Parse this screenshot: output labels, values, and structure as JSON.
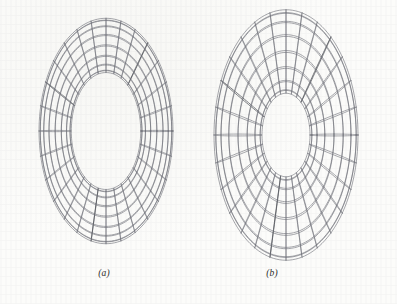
{
  "page": {
    "background_color": "#fbfbf9",
    "ink_color": "#6e7078",
    "figure_kind": "wireframe-torus-pair"
  },
  "panels": [
    {
      "id": "panel-a",
      "caption": "(a)",
      "caption_x": 104,
      "caption_y": 268,
      "box": {
        "x": 30,
        "y": 8,
        "width": 152,
        "height": 248
      },
      "torus": {
        "center_x": 106,
        "center_y": 131,
        "major_radius": 82,
        "minor_radius": 26,
        "squash_x": 0.62,
        "tilt_deg": 18,
        "u_segments": 28,
        "v_segments": 16,
        "meridian_count": 28,
        "parallel_count": 16,
        "band_emphasis": [
          4,
          12,
          20
        ]
      }
    },
    {
      "id": "panel-b",
      "caption": "(b)",
      "caption_x": 272,
      "caption_y": 268,
      "box": {
        "x": 202,
        "y": 14,
        "width": 166,
        "height": 244
      },
      "torus": {
        "center_x": 286,
        "center_y": 135,
        "major_radius": 80,
        "minor_radius": 40,
        "squash_x": 0.6,
        "tilt_deg": 18,
        "u_segments": 28,
        "v_segments": 16,
        "meridian_count": 28,
        "parallel_count": 16,
        "band_emphasis": [
          4,
          12,
          20
        ]
      }
    }
  ]
}
